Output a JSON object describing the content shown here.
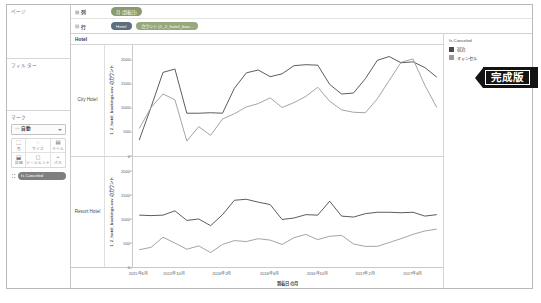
{
  "sidebar": {
    "pages": {
      "title": "ページ"
    },
    "filters": {
      "title": "フィルター"
    },
    "marks": {
      "title": "マーク",
      "type_glyph": "〰",
      "type_label": "自動",
      "buttons": [
        {
          "icon": "⬚",
          "label": "色"
        },
        {
          "icon": "◌",
          "label": "サイズ"
        },
        {
          "icon": "▤",
          "label": "ラベル"
        },
        {
          "icon": "⬓",
          "label": "詳細"
        },
        {
          "icon": "◻",
          "label": "ツールヒント"
        },
        {
          "icon": "⌁",
          "label": "パス"
        }
      ],
      "pill": "Is Canceled"
    }
  },
  "shelves": {
    "columns": {
      "label": "列",
      "glyph": "⊞",
      "pills": [
        {
          "text": "月 (到着日)",
          "color": "green"
        }
      ]
    },
    "rows": {
      "label": "行",
      "glyph": "⊟",
      "pills": [
        {
          "text": "Hotel",
          "color": "blue"
        },
        {
          "text": "カウント (1_2_hotel_boo...",
          "color": "green2"
        }
      ]
    }
  },
  "viz": {
    "column_header": "Hotel",
    "row_headers": [
      "City Hotel",
      "Resort Hotel"
    ],
    "legend": {
      "title": "Is Canceled",
      "items": [
        {
          "label": "宿泊",
          "color": "#4a4a4a"
        },
        {
          "label": "キャンセル",
          "color": "#9a9a9a"
        }
      ]
    },
    "ribbon": "完成版"
  },
  "chart_data": {
    "type": "line",
    "title": "",
    "xlabel": "到着日 の月",
    "ylabel": "1_2_hotel_bookings.csv のカウント",
    "ylim": [
      0,
      2300
    ],
    "yticks": [
      0,
      500,
      1000,
      1500,
      2000
    ],
    "grid": false,
    "legend_position": "right",
    "xticks": [
      "2015年6月",
      "2015年10月",
      "2016年2月",
      "2016年6月",
      "2016年10月",
      "2017年2月",
      "2017年6月"
    ],
    "x": [
      "2015年7月",
      "2015年8月",
      "2015年9月",
      "2015年10月",
      "2015年11月",
      "2015年12月",
      "2016年1月",
      "2016年2月",
      "2016年3月",
      "2016年4月",
      "2016年5月",
      "2016年6月",
      "2016年7月",
      "2016年8月",
      "2016年9月",
      "2016年10月",
      "2016年11月",
      "2016年12月",
      "2017年1月",
      "2017年2月",
      "2017年3月",
      "2017年4月",
      "2017年5月",
      "2017年6月",
      "2017年7月",
      "2017年8月"
    ],
    "panels": [
      {
        "name": "City Hotel",
        "series": [
          {
            "name": "宿泊",
            "color": "#4a4a4a",
            "values": [
              320,
              1010,
              1730,
              1800,
              880,
              880,
              890,
              880,
              1400,
              1720,
              1780,
              1640,
              1700,
              1870,
              1890,
              1880,
              1480,
              1280,
              1300,
              1600,
              1980,
              2060,
              1930,
              1950,
              1830,
              1630
            ]
          },
          {
            "name": "キャンセル",
            "color": "#9a9a9a",
            "values": [
              560,
              1000,
              1280,
              1160,
              300,
              600,
              420,
              760,
              870,
              1010,
              1080,
              1200,
              1000,
              1100,
              1230,
              1420,
              1130,
              950,
              900,
              890,
              1180,
              1560,
              1940,
              2010,
              1460,
              1000
            ]
          }
        ]
      },
      {
        "name": "Resort Hotel",
        "series": [
          {
            "name": "宿泊",
            "color": "#4a4a4a",
            "values": [
              1090,
              1080,
              1090,
              1180,
              980,
              1010,
              870,
              1100,
              1400,
              1420,
              1360,
              1310,
              1000,
              1030,
              1100,
              1090,
              1380,
              1070,
              1050,
              1120,
              1150,
              1150,
              1140,
              1150,
              1070,
              1100
            ]
          },
          {
            "name": "キャンセル",
            "color": "#9a9a9a",
            "values": [
              370,
              420,
              630,
              510,
              380,
              450,
              310,
              480,
              560,
              540,
              600,
              570,
              480,
              620,
              690,
              580,
              650,
              670,
              490,
              440,
              440,
              520,
              600,
              690,
              760,
              800
            ]
          }
        ]
      }
    ]
  }
}
